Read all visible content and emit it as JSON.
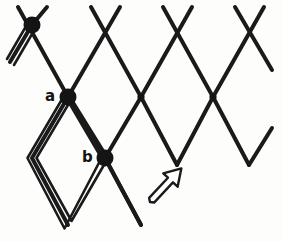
{
  "figure": {
    "background_color": "#fdfdfc",
    "stroke_color": "#1a1a1a",
    "label_color": "#141414"
  },
  "labels": {
    "a": "a",
    "b": "b"
  },
  "geometry": {
    "width": 283,
    "height": 242,
    "cell_half_width": 36,
    "cell_half_height": 34,
    "row_y": [
      25,
      97,
      158,
      225
    ],
    "col_x_top": [
      32,
      105,
      177,
      249
    ],
    "col_x_mid": [
      68,
      141,
      213
    ],
    "stroke_width": 4,
    "double_stroke_gap": 4,
    "node_radius": 8
  },
  "nodes": [
    {
      "name": "top-left-node",
      "x": 32,
      "y": 25,
      "marked": true,
      "label": ""
    },
    {
      "name": "node-a",
      "x": 68,
      "y": 97,
      "marked": true,
      "label": "a"
    },
    {
      "name": "node-b",
      "x": 105,
      "y": 158,
      "marked": true,
      "label": "b"
    },
    {
      "name": "mid-node-2",
      "x": 141,
      "y": 97,
      "marked": false,
      "label": ""
    },
    {
      "name": "mid-node-3",
      "x": 213,
      "y": 97,
      "marked": false,
      "label": ""
    }
  ],
  "highlighted_cell": {
    "name": "double-outlined-rhombus",
    "vertices": [
      [
        68,
        97
      ],
      [
        105,
        158
      ],
      [
        68,
        225
      ],
      [
        32,
        158
      ]
    ],
    "style": "double-line",
    "tail_from": [
      32,
      25
    ],
    "tail_to": [
      10,
      62
    ]
  },
  "arrow": {
    "name": "pointer-arrow",
    "style": "hollow-outline",
    "from_x": 148,
    "from_y": 203,
    "to_x": 187,
    "to_y": 161,
    "angle_degrees": 47,
    "fill": "#ffffff",
    "stroke": "#1a1a1a"
  }
}
